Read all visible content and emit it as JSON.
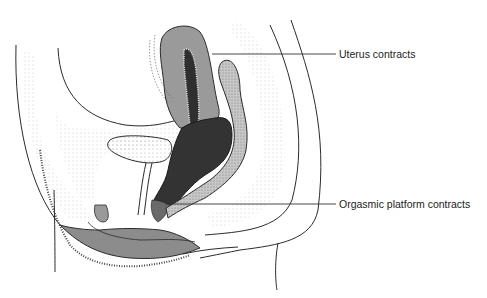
{
  "figure": {
    "labels": [
      {
        "text": "Uterus contracts",
        "x": 339,
        "y": 48,
        "leader_from": [
          212,
          54
        ],
        "leader_to": [
          336,
          54
        ]
      },
      {
        "text": "Orgasmic platform contracts",
        "x": 339,
        "y": 198,
        "leader_from": [
          165,
          204
        ],
        "leader_to": [
          336,
          204
        ]
      }
    ],
    "colors": {
      "background": "#ffffff",
      "outline": "#2b2b2b",
      "uterus_wall": "#9a9a9a",
      "vaginal_cavity": "#3a3a3a",
      "labia": "#8c8c8c",
      "rectum": "#bdbdbd",
      "tissue": "#f2f2f2"
    }
  }
}
